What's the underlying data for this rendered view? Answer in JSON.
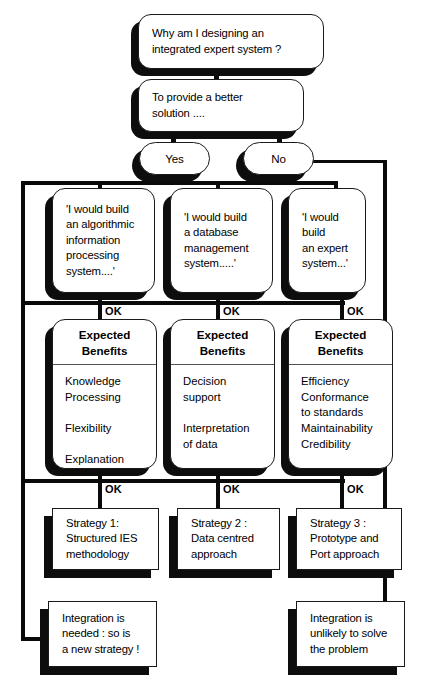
{
  "diagram": {
    "title": "Why am I designing an integrated expert system ?",
    "nodes": {
      "q_root": "Why am I designing an\nintegrated expert system ?",
      "q_better": "To provide a better\nsolution ....",
      "yes": "Yes",
      "no": "No",
      "claim_1": "'I would build\nan algorithmic\ninformation\nprocessing\nsystem....'",
      "claim_2": "'I would build\na database\nmanagement\nsystem.....'",
      "claim_3": "'I would build\nan expert\nsystem...'",
      "benefits_header": "Expected\nBenefits",
      "benefits_1": "Knowledge\nProcessing\n\nFlexibility\n\nExplanation",
      "benefits_2": "Decision\nsupport\n\nInterpretation\nof data",
      "benefits_3": "Efficiency\nConformance\nto standards\nMaintainability\nCredibility",
      "strategy_1": "Strategy 1:\nStructured IES\nmethodology",
      "strategy_2": "Strategy 2 :\nData centred\napproach",
      "strategy_3": "Strategy 3 :\nPrototype and\nPort approach",
      "outcome_yes": "Integration is\nneeded : so is\na new strategy !",
      "outcome_no": "Integration is\nunlikely to solve\nthe problem"
    },
    "edge_labels": {
      "ok": "OK"
    },
    "colors": {
      "ink": "#0d0d0d",
      "face": "#ffffff",
      "shadow": "#0d0d0d"
    }
  }
}
